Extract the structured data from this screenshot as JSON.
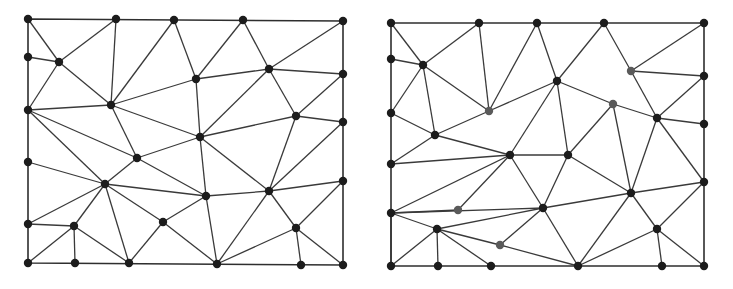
{
  "figure": {
    "width": 733,
    "height": 289,
    "background": "#ffffff",
    "node_color": "#1c1c1c",
    "highlight_node_color": "#5a5a5a",
    "edge_color": "#3a3a3a",
    "node_radius": 4.2
  },
  "meshes": [
    {
      "name": "left-mesh",
      "border": [
        [
          28,
          19
        ],
        [
          343,
          21
        ],
        [
          343,
          265
        ],
        [
          28,
          263
        ]
      ],
      "nodes": [
        [
          28,
          19
        ],
        [
          116,
          19
        ],
        [
          174,
          20
        ],
        [
          243,
          20
        ],
        [
          343,
          21
        ],
        [
          28,
          57
        ],
        [
          59,
          62
        ],
        [
          196,
          79
        ],
        [
          269,
          69
        ],
        [
          343,
          74
        ],
        [
          28,
          110
        ],
        [
          111,
          105
        ],
        [
          296,
          116
        ],
        [
          343,
          122
        ],
        [
          200,
          137
        ],
        [
          137,
          158
        ],
        [
          28,
          162
        ],
        [
          105,
          184
        ],
        [
          206,
          196
        ],
        [
          269,
          191
        ],
        [
          343,
          181
        ],
        [
          28,
          224
        ],
        [
          74,
          226
        ],
        [
          163,
          222
        ],
        [
          296,
          228
        ],
        [
          28,
          263
        ],
        [
          75,
          263
        ],
        [
          129,
          263
        ],
        [
          217,
          264
        ],
        [
          301,
          265
        ],
        [
          343,
          265
        ]
      ],
      "highlight": [],
      "edges": [
        [
          0,
          6
        ],
        [
          6,
          1
        ],
        [
          5,
          6
        ],
        [
          6,
          10
        ],
        [
          6,
          11
        ],
        [
          1,
          11
        ],
        [
          2,
          11
        ],
        [
          2,
          7
        ],
        [
          7,
          3
        ],
        [
          3,
          8
        ],
        [
          8,
          4
        ],
        [
          8,
          9
        ],
        [
          7,
          11
        ],
        [
          7,
          8
        ],
        [
          7,
          14
        ],
        [
          11,
          10
        ],
        [
          11,
          15
        ],
        [
          11,
          14
        ],
        [
          8,
          14
        ],
        [
          8,
          12
        ],
        [
          12,
          9
        ],
        [
          12,
          13
        ],
        [
          12,
          14
        ],
        [
          12,
          19
        ],
        [
          13,
          19
        ],
        [
          10,
          15
        ],
        [
          10,
          17
        ],
        [
          14,
          15
        ],
        [
          15,
          17
        ],
        [
          15,
          18
        ],
        [
          14,
          18
        ],
        [
          14,
          19
        ],
        [
          16,
          17
        ],
        [
          17,
          18
        ],
        [
          18,
          19
        ],
        [
          19,
          20
        ],
        [
          17,
          21
        ],
        [
          17,
          22
        ],
        [
          17,
          27
        ],
        [
          17,
          23
        ],
        [
          18,
          23
        ],
        [
          18,
          28
        ],
        [
          19,
          28
        ],
        [
          19,
          24
        ],
        [
          20,
          24
        ],
        [
          24,
          28
        ],
        [
          24,
          29
        ],
        [
          24,
          30
        ],
        [
          22,
          26
        ],
        [
          21,
          22
        ],
        [
          22,
          25
        ],
        [
          22,
          27
        ],
        [
          23,
          27
        ],
        [
          23,
          28
        ]
      ]
    },
    {
      "name": "right-mesh",
      "border": [
        [
          391,
          23
        ],
        [
          704,
          23
        ],
        [
          704,
          266
        ],
        [
          391,
          266
        ]
      ],
      "nodes": [
        [
          391,
          23
        ],
        [
          479,
          23
        ],
        [
          537,
          23
        ],
        [
          604,
          23
        ],
        [
          704,
          23
        ],
        [
          391,
          59
        ],
        [
          423,
          65
        ],
        [
          631,
          71
        ],
        [
          704,
          76
        ],
        [
          391,
          113
        ],
        [
          489,
          111
        ],
        [
          557,
          81
        ],
        [
          613,
          104
        ],
        [
          657,
          118
        ],
        [
          704,
          124
        ],
        [
          435,
          135
        ],
        [
          391,
          164
        ],
        [
          510,
          155
        ],
        [
          568,
          155
        ],
        [
          704,
          182
        ],
        [
          631,
          193
        ],
        [
          391,
          213
        ],
        [
          458,
          210
        ],
        [
          543,
          208
        ],
        [
          437,
          229
        ],
        [
          657,
          229
        ],
        [
          500,
          245
        ],
        [
          391,
          266
        ],
        [
          438,
          266
        ],
        [
          491,
          266
        ],
        [
          578,
          266
        ],
        [
          662,
          266
        ],
        [
          704,
          266
        ]
      ],
      "highlight": [
        7,
        10,
        12,
        22,
        26
      ],
      "edges": [
        [
          0,
          6
        ],
        [
          6,
          1
        ],
        [
          5,
          6
        ],
        [
          6,
          9
        ],
        [
          6,
          15
        ],
        [
          6,
          10
        ],
        [
          1,
          10
        ],
        [
          2,
          10
        ],
        [
          2,
          11
        ],
        [
          11,
          3
        ],
        [
          3,
          7
        ],
        [
          7,
          4
        ],
        [
          7,
          8
        ],
        [
          7,
          13
        ],
        [
          10,
          11
        ],
        [
          10,
          15
        ],
        [
          11,
          12
        ],
        [
          11,
          17
        ],
        [
          11,
          18
        ],
        [
          12,
          13
        ],
        [
          12,
          18
        ],
        [
          12,
          20
        ],
        [
          13,
          8
        ],
        [
          13,
          14
        ],
        [
          13,
          19
        ],
        [
          13,
          20
        ],
        [
          9,
          15
        ],
        [
          15,
          16
        ],
        [
          15,
          17
        ],
        [
          16,
          17
        ],
        [
          17,
          18
        ],
        [
          17,
          21
        ],
        [
          17,
          23
        ],
        [
          18,
          23
        ],
        [
          18,
          20
        ],
        [
          20,
          19
        ],
        [
          20,
          23
        ],
        [
          20,
          25
        ],
        [
          20,
          30
        ],
        [
          19,
          25
        ],
        [
          21,
          22
        ],
        [
          22,
          17
        ],
        [
          21,
          23
        ],
        [
          21,
          24
        ],
        [
          21,
          27
        ],
        [
          24,
          23
        ],
        [
          24,
          27
        ],
        [
          24,
          28
        ],
        [
          24,
          29
        ],
        [
          24,
          26
        ],
        [
          26,
          23
        ],
        [
          26,
          30
        ],
        [
          23,
          30
        ],
        [
          25,
          30
        ],
        [
          25,
          31
        ],
        [
          25,
          32
        ]
      ]
    }
  ]
}
